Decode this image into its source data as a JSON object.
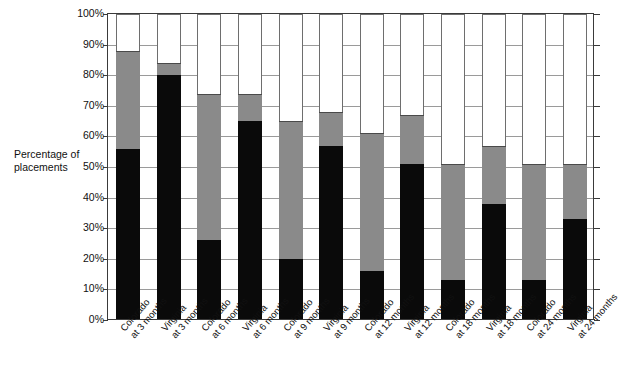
{
  "chart_data": {
    "type": "bar",
    "subtype": "stacked-bar",
    "title": "",
    "xlabel": "",
    "ylabel": "Percentage of placements",
    "ylim": [
      0,
      100
    ],
    "grid": true,
    "legend_position": "none",
    "y_ticks": [
      "0%",
      "10%",
      "20%",
      "30%",
      "40%",
      "50%",
      "60%",
      "70%",
      "80%",
      "90%",
      "100%"
    ],
    "y_tick_values": [
      0,
      10,
      20,
      30,
      40,
      50,
      60,
      70,
      80,
      90,
      100
    ],
    "categories": [
      "Colorado at 3 months",
      "Virginia at 3 months",
      "Colorado at 6 months",
      "Virginia at 6 months",
      "Colorado at 9 months",
      "Virginia at 9 months",
      "Colorado at 12 months",
      "Virginia at 12 months",
      "Colorado at 18 months",
      "Virginia at 18 months",
      "Colorado at 24 months",
      "Virginia at 24 months"
    ],
    "category_lines": [
      {
        "line1": "Colorado",
        "line2": "at 3 months"
      },
      {
        "line1": "Virginia",
        "line2": "at 3 months"
      },
      {
        "line1": "Colorado",
        "line2": "at 6 months"
      },
      {
        "line1": "Virginia",
        "line2": "at 6 months"
      },
      {
        "line1": "Colorado",
        "line2": "at 9 months"
      },
      {
        "line1": "Virginia",
        "line2": "at 9 months"
      },
      {
        "line1": "Colorado",
        "line2": "at 12 months"
      },
      {
        "line1": "Virginia",
        "line2": "at 12 months"
      },
      {
        "line1": "Colorado",
        "line2": "at 18 months"
      },
      {
        "line1": "Virginia",
        "line2": "at 18 months"
      },
      {
        "line1": "Colorado",
        "line2": "at 24 months"
      },
      {
        "line1": "Virginia",
        "line2": "at 24 months"
      }
    ],
    "series": [
      {
        "name": "black-segment",
        "color": "#0a0a0a",
        "values": [
          56,
          80,
          26,
          65,
          20,
          57,
          16,
          51,
          13,
          38,
          13,
          33
        ]
      },
      {
        "name": "gray-segment",
        "color": "#8a8a8a",
        "cumulative_top": [
          88,
          84,
          74,
          74,
          65,
          68,
          61,
          67,
          51,
          57,
          51,
          51
        ],
        "values": [
          32,
          4,
          48,
          9,
          45,
          11,
          45,
          16,
          38,
          19,
          38,
          18
        ]
      },
      {
        "name": "white-segment",
        "color": "#ffffff",
        "cumulative_top": [
          100,
          100,
          100,
          100,
          100,
          100,
          100,
          100,
          100,
          100,
          100,
          100
        ],
        "values": [
          12,
          16,
          26,
          26,
          35,
          32,
          39,
          33,
          49,
          43,
          49,
          49
        ]
      }
    ]
  }
}
